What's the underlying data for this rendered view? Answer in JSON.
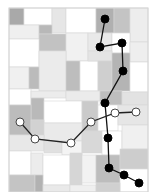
{
  "canvas": {
    "width": 158,
    "height": 192,
    "background": "#ffffff",
    "frame": {
      "x": 9,
      "y": 8,
      "w": 139,
      "h": 184,
      "stroke": "#d4d4d4"
    }
  },
  "tiles": [
    {
      "x": 9,
      "y": 8,
      "w": 15,
      "h": 17,
      "fill": "#a9a9a9"
    },
    {
      "x": 24,
      "y": 8,
      "w": 28,
      "h": 17,
      "fill": "#ffffff"
    },
    {
      "x": 52,
      "y": 8,
      "w": 14,
      "h": 25,
      "fill": "#e6e6e6"
    },
    {
      "x": 66,
      "y": 8,
      "w": 30,
      "h": 25,
      "fill": "#ffffff"
    },
    {
      "x": 96,
      "y": 8,
      "w": 18,
      "h": 25,
      "fill": "#b0b0b0"
    },
    {
      "x": 114,
      "y": 8,
      "w": 16,
      "h": 25,
      "fill": "#c4c4c4"
    },
    {
      "x": 130,
      "y": 8,
      "w": 18,
      "h": 34,
      "fill": "#ededed"
    },
    {
      "x": 9,
      "y": 25,
      "w": 30,
      "h": 14,
      "fill": "#efefef"
    },
    {
      "x": 39,
      "y": 25,
      "w": 13,
      "h": 9,
      "fill": "#b8b8b8"
    },
    {
      "x": 39,
      "y": 34,
      "w": 27,
      "h": 17,
      "fill": "#c2c2c2"
    },
    {
      "x": 66,
      "y": 33,
      "w": 22,
      "h": 28,
      "fill": "#f1f1f1"
    },
    {
      "x": 88,
      "y": 33,
      "w": 24,
      "h": 18,
      "fill": "#e9e9e9"
    },
    {
      "x": 112,
      "y": 33,
      "w": 18,
      "h": 20,
      "fill": "#ffffff"
    },
    {
      "x": 130,
      "y": 42,
      "w": 18,
      "h": 20,
      "fill": "#eeeeee"
    },
    {
      "x": 9,
      "y": 39,
      "w": 30,
      "h": 28,
      "fill": "#ffffff"
    },
    {
      "x": 39,
      "y": 51,
      "w": 27,
      "h": 40,
      "fill": "#ebebeb"
    },
    {
      "x": 66,
      "y": 61,
      "w": 14,
      "h": 30,
      "fill": "#bdbdbd"
    },
    {
      "x": 80,
      "y": 61,
      "w": 18,
      "h": 30,
      "fill": "#ffffff"
    },
    {
      "x": 88,
      "y": 51,
      "w": 24,
      "h": 10,
      "fill": "#e4e4e4"
    },
    {
      "x": 98,
      "y": 61,
      "w": 14,
      "h": 30,
      "fill": "#cfcfcf"
    },
    {
      "x": 112,
      "y": 53,
      "w": 18,
      "h": 38,
      "fill": "#b4b4b4"
    },
    {
      "x": 130,
      "y": 62,
      "w": 18,
      "h": 30,
      "fill": "#ffffff"
    },
    {
      "x": 9,
      "y": 67,
      "w": 20,
      "h": 22,
      "fill": "#f0f0f0"
    },
    {
      "x": 29,
      "y": 67,
      "w": 10,
      "h": 22,
      "fill": "#bbbbbb"
    },
    {
      "x": 9,
      "y": 89,
      "w": 22,
      "h": 16,
      "fill": "#ffffff"
    },
    {
      "x": 31,
      "y": 91,
      "w": 35,
      "h": 7,
      "fill": "#ececec"
    },
    {
      "x": 66,
      "y": 91,
      "w": 34,
      "h": 10,
      "fill": "#ebebeb"
    },
    {
      "x": 100,
      "y": 91,
      "w": 22,
      "h": 14,
      "fill": "#bebebe"
    },
    {
      "x": 122,
      "y": 92,
      "w": 26,
      "h": 13,
      "fill": "#e2e2e2"
    },
    {
      "x": 31,
      "y": 98,
      "w": 13,
      "h": 22,
      "fill": "#b9b9b9"
    },
    {
      "x": 44,
      "y": 101,
      "w": 38,
      "h": 22,
      "fill": "#ffffff"
    },
    {
      "x": 82,
      "y": 101,
      "w": 16,
      "h": 30,
      "fill": "#cacaca"
    },
    {
      "x": 98,
      "y": 105,
      "w": 20,
      "h": 26,
      "fill": "#ffffff"
    },
    {
      "x": 118,
      "y": 105,
      "w": 30,
      "h": 20,
      "fill": "#e6e6e6"
    },
    {
      "x": 9,
      "y": 105,
      "w": 22,
      "h": 30,
      "fill": "#bcbcbc"
    },
    {
      "x": 31,
      "y": 120,
      "w": 13,
      "h": 15,
      "fill": "#d2d2d2"
    },
    {
      "x": 44,
      "y": 123,
      "w": 38,
      "h": 18,
      "fill": "#eaeaea"
    },
    {
      "x": 9,
      "y": 135,
      "w": 35,
      "h": 16,
      "fill": "#e8e8e8"
    },
    {
      "x": 44,
      "y": 141,
      "w": 18,
      "h": 12,
      "fill": "#e0e0e0"
    },
    {
      "x": 62,
      "y": 141,
      "w": 20,
      "h": 14,
      "fill": "#f4f4f4"
    },
    {
      "x": 82,
      "y": 131,
      "w": 20,
      "h": 22,
      "fill": "#d8d8d8"
    },
    {
      "x": 102,
      "y": 131,
      "w": 20,
      "h": 24,
      "fill": "#ffffff"
    },
    {
      "x": 122,
      "y": 125,
      "w": 26,
      "h": 24,
      "fill": "#f0f0f0"
    },
    {
      "x": 9,
      "y": 151,
      "w": 22,
      "h": 24,
      "fill": "#ffffff"
    },
    {
      "x": 31,
      "y": 153,
      "w": 12,
      "h": 22,
      "fill": "#ececec"
    },
    {
      "x": 43,
      "y": 155,
      "w": 27,
      "h": 30,
      "fill": "#ffffff"
    },
    {
      "x": 70,
      "y": 153,
      "w": 12,
      "h": 32,
      "fill": "#d6d6d6"
    },
    {
      "x": 82,
      "y": 155,
      "w": 14,
      "h": 28,
      "fill": "#f2f2f2"
    },
    {
      "x": 96,
      "y": 155,
      "w": 24,
      "h": 28,
      "fill": "#bdbdbd"
    },
    {
      "x": 120,
      "y": 149,
      "w": 28,
      "h": 20,
      "fill": "#cdcdcd"
    },
    {
      "x": 120,
      "y": 169,
      "w": 28,
      "h": 23,
      "fill": "#ffffff"
    },
    {
      "x": 9,
      "y": 175,
      "w": 26,
      "h": 17,
      "fill": "#c4c4c4"
    },
    {
      "x": 35,
      "y": 175,
      "w": 8,
      "h": 17,
      "fill": "#b2b2b2"
    },
    {
      "x": 43,
      "y": 185,
      "w": 27,
      "h": 7,
      "fill": "#e9e9e9"
    },
    {
      "x": 70,
      "y": 185,
      "w": 26,
      "h": 7,
      "fill": "#efefef"
    },
    {
      "x": 96,
      "y": 183,
      "w": 24,
      "h": 9,
      "fill": "#d0d0d0"
    }
  ],
  "paths": [
    {
      "name": "black-path",
      "line_color": "#111111",
      "marker_fill": "#000000",
      "marker_stroke": "#000000",
      "marker_radius": 4,
      "points": [
        [
          105,
          19
        ],
        [
          100,
          47
        ],
        [
          122,
          43
        ],
        [
          123,
          71
        ],
        [
          105,
          103
        ],
        [
          108,
          138
        ],
        [
          109,
          168
        ],
        [
          124,
          175
        ],
        [
          139,
          183
        ]
      ]
    },
    {
      "name": "white-path",
      "line_color": "#222222",
      "marker_fill": "#ffffff",
      "marker_stroke": "#333333",
      "marker_radius": 4,
      "points": [
        [
          20,
          122
        ],
        [
          35,
          139
        ],
        [
          71,
          143
        ],
        [
          91,
          122
        ],
        [
          115,
          113
        ],
        [
          136,
          112
        ]
      ]
    }
  ]
}
